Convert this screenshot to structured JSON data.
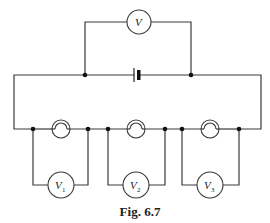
{
  "figure": {
    "caption": "Fig. 6.7",
    "battery": {
      "label": ""
    },
    "main_voltmeter": {
      "symbol": "V",
      "subscript": ""
    },
    "segments": [
      {
        "lamp": "lamp-1",
        "voltmeter": {
          "symbol": "V",
          "subscript": "1"
        }
      },
      {
        "lamp": "lamp-2",
        "voltmeter": {
          "symbol": "V",
          "subscript": "2"
        }
      },
      {
        "lamp": "lamp-3",
        "voltmeter": {
          "symbol": "V",
          "subscript": "3"
        }
      }
    ]
  }
}
